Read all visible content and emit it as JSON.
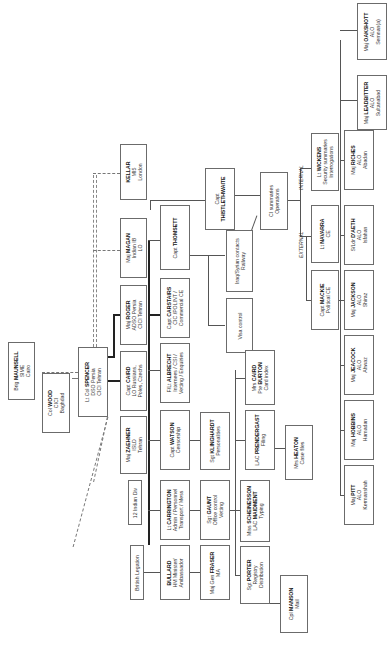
{
  "diagram": {
    "orientation": "rotated-90-ccw",
    "nodes": [
      {
        "id": "maunsell",
        "rank": "Brig",
        "name": "MAUNSELL",
        "lines": [
          "SIME",
          "Cairo"
        ]
      },
      {
        "id": "wood",
        "rank": "Col",
        "name": "WOOD",
        "lines": [
          "CICI",
          "Baghdad"
        ]
      },
      {
        "id": "spencer",
        "rank": "Lt Col",
        "name": "SPENCER",
        "lines": [
          "DSO Persia",
          "CICI Tehran"
        ]
      },
      {
        "id": "kellar",
        "rank": "",
        "name": "KELLAR",
        "lines": [
          "MI5",
          "London"
        ]
      },
      {
        "id": "magan",
        "rank": "Maj",
        "name": "MAGAN",
        "lines": [
          "Indian IB",
          "LO"
        ]
      },
      {
        "id": "roger",
        "rank": "Maj",
        "name": "ROGER",
        "lines": [
          "ADSO Persia",
          "CICI Tehran"
        ]
      },
      {
        "id": "caird",
        "rank": "Capt",
        "name": "CAIRD",
        "lines": [
          "LO Russians,",
          "Poles, Czechs"
        ]
      },
      {
        "id": "zaehner",
        "rank": "Maj",
        "name": "ZAEHNER",
        "lines": [
          "ISLD",
          "Tehran"
        ]
      },
      {
        "id": "indian_div",
        "rank": "",
        "name": "",
        "lines": [
          "12 Indian Div"
        ]
      },
      {
        "id": "british_legation",
        "rank": "",
        "name": "",
        "lines": [
          "British Legation"
        ]
      },
      {
        "id": "thomsett",
        "rank": "Capt",
        "name": "THOMSETT",
        "lines": []
      },
      {
        "id": "carstairs",
        "rank": "Capt",
        "name": "CARSTAIRS",
        "lines": [
          "CIC /POLINT /",
          "Commercial CE"
        ]
      },
      {
        "id": "albrecht",
        "rank": "F/Lt",
        "name": "ALBRECHT",
        "lines": [
          "Internees / CSI /",
          "Vetting / Enquiries"
        ]
      },
      {
        "id": "watson",
        "rank": "Capt",
        "name": "WATSON",
        "lines": [
          "Censorship"
        ]
      },
      {
        "id": "carrington",
        "rank": "Lt",
        "name": "CARRINGTON",
        "lines": [
          "Admin / Personnel",
          "Transport / Mess"
        ]
      },
      {
        "id": "bullard",
        "rank": "",
        "name": "BULLARD",
        "lines": [
          "HM Minister/",
          "Ambassador"
        ]
      },
      {
        "id": "thistlethwaite",
        "rank": "Capt",
        "name": "THISTLETHWAITE",
        "lines": []
      },
      {
        "id": "iraq_syrian",
        "rank": "",
        "name": "",
        "lines": [
          "Iraq/Syrian contacts",
          "Railway"
        ]
      },
      {
        "id": "visa",
        "rank": "",
        "name": "",
        "lines": [
          "Visa control"
        ]
      },
      {
        "id": "klinghardt",
        "rank": "Sgt",
        "name": "KLINGHARDT",
        "lines": [
          "Personalities"
        ]
      },
      {
        "id": "gaunt",
        "rank": "Sgt",
        "name": "GAUNT",
        "lines": [
          "Office control",
          "Vetting"
        ]
      },
      {
        "id": "fraser",
        "rank": "Maj Gen",
        "name": "FRASER",
        "lines": [
          "MA"
        ]
      },
      {
        "id": "ci_summaries",
        "rank": "",
        "name": "",
        "lines": [
          "CI summaries",
          "Operations"
        ]
      },
      {
        "id": "caird_burton",
        "rank": "Mrs",
        "name": "CAIRD",
        "lines": [],
        "second_rank": "Pte",
        "second_name": "BURTON",
        "tail": "Card index"
      },
      {
        "id": "prendergast",
        "rank": "LAC",
        "name": "PRENDERGAST",
        "lines": [
          "Filing"
        ]
      },
      {
        "id": "scheinesson",
        "rank": "Miss",
        "name": "SCHEINESSON",
        "lines": [],
        "second_rank": "LAC",
        "second_name": "MAIDMENT",
        "tail": "Typing"
      },
      {
        "id": "porter",
        "rank": "Sgt",
        "name": "PORTER",
        "lines": [
          "Registry",
          "Distribution"
        ]
      },
      {
        "id": "manson",
        "rank": "Cpl",
        "name": "MANSON",
        "lines": [
          "Mail"
        ]
      },
      {
        "id": "heaton",
        "rank": "Mrs",
        "name": "HEATON",
        "lines": [
          "Case files"
        ]
      },
      {
        "id": "wickens",
        "rank": "Lt",
        "name": "WICKENS",
        "lines": [
          "Security summaries",
          "Interrogations"
        ]
      },
      {
        "id": "navarra",
        "rank": "Lt",
        "name": "NAVARRA",
        "lines": [
          "CE"
        ]
      },
      {
        "id": "mackie",
        "rank": "Capt",
        "name": "MACKIE",
        "lines": [
          "Political CE"
        ]
      },
      {
        "id": "riches",
        "rank": "Maj",
        "name": "RICHES",
        "lines": [
          "ALO",
          "Abadan"
        ]
      },
      {
        "id": "daeth",
        "rank": "S/Ldr",
        "name": "D'AETH",
        "lines": [
          "ALO",
          "Isfahan"
        ]
      },
      {
        "id": "jackson",
        "rank": "Maj",
        "name": "JACKSON",
        "lines": [
          "ALO",
          "Shiraz"
        ]
      },
      {
        "id": "jeacock",
        "rank": "Maj",
        "name": "JEACOCK",
        "lines": [
          "ALO",
          "Ahwaz"
        ]
      },
      {
        "id": "hobbins",
        "rank": "Maj",
        "name": "HOBBINS",
        "lines": [
          "ALO",
          "Hamadan"
        ]
      },
      {
        "id": "pitt",
        "rank": "Maj",
        "name": "PITT",
        "lines": [
          "ALO",
          "Kermanshah"
        ]
      },
      {
        "id": "leadbitter",
        "rank": "Maj",
        "name": "LEADBITTER",
        "lines": [
          "ALO",
          "Sultanabad"
        ]
      },
      {
        "id": "oakshott",
        "rank": "Maj",
        "name": "OAKSHOTT",
        "lines": [
          "ALO",
          "Semnan(a)"
        ]
      }
    ],
    "labels": {
      "external": "EXTERNAL",
      "internal": "INTERNAL"
    }
  }
}
